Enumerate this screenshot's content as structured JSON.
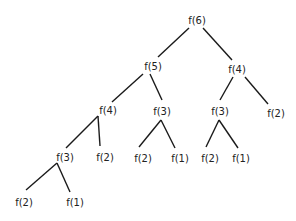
{
  "diagram": {
    "nodes": [
      {
        "id": "n0",
        "label": "f(6)",
        "x": 197,
        "y": 20
      },
      {
        "id": "n1",
        "label": "f(5)",
        "x": 153,
        "y": 66
      },
      {
        "id": "n2",
        "label": "f(4)",
        "x": 237,
        "y": 69
      },
      {
        "id": "n3",
        "label": "f(4)",
        "x": 108,
        "y": 110
      },
      {
        "id": "n4",
        "label": "f(3)",
        "x": 162,
        "y": 111
      },
      {
        "id": "n5",
        "label": "f(3)",
        "x": 220,
        "y": 111
      },
      {
        "id": "n6",
        "label": "f(2)",
        "x": 276,
        "y": 113
      },
      {
        "id": "n7",
        "label": "f(3)",
        "x": 65,
        "y": 157
      },
      {
        "id": "n8",
        "label": "f(2)",
        "x": 105,
        "y": 157
      },
      {
        "id": "n9",
        "label": "f(2)",
        "x": 143,
        "y": 158
      },
      {
        "id": "n10",
        "label": "f(1)",
        "x": 180,
        "y": 158
      },
      {
        "id": "n11",
        "label": "f(2)",
        "x": 210,
        "y": 158
      },
      {
        "id": "n12",
        "label": "f(1)",
        "x": 241,
        "y": 158
      },
      {
        "id": "n13",
        "label": "f(2)",
        "x": 24,
        "y": 202
      },
      {
        "id": "n14",
        "label": "f(1)",
        "x": 75,
        "y": 202
      }
    ],
    "edges": [
      {
        "from": "n0",
        "to": "n1",
        "x1": 189,
        "y1": 28,
        "x2": 158,
        "y2": 57
      },
      {
        "from": "n0",
        "to": "n2",
        "x1": 203,
        "y1": 28,
        "x2": 232,
        "y2": 60
      },
      {
        "from": "n1",
        "to": "n3",
        "x1": 143,
        "y1": 74,
        "x2": 112,
        "y2": 102
      },
      {
        "from": "n1",
        "to": "n4",
        "x1": 150,
        "y1": 74,
        "x2": 162,
        "y2": 100
      },
      {
        "from": "n2",
        "to": "n5",
        "x1": 233,
        "y1": 77,
        "x2": 220,
        "y2": 100
      },
      {
        "from": "n2",
        "to": "n6",
        "x1": 245,
        "y1": 77,
        "x2": 268,
        "y2": 104
      },
      {
        "from": "n3",
        "to": "n7",
        "x1": 98,
        "y1": 116,
        "x2": 66,
        "y2": 148
      },
      {
        "from": "n3",
        "to": "n8",
        "x1": 98,
        "y1": 116,
        "x2": 100,
        "y2": 146
      },
      {
        "from": "n4",
        "to": "n9",
        "x1": 161,
        "y1": 120,
        "x2": 139,
        "y2": 147
      },
      {
        "from": "n4",
        "to": "n10",
        "x1": 161,
        "y1": 120,
        "x2": 175,
        "y2": 148
      },
      {
        "from": "n5",
        "to": "n11",
        "x1": 219,
        "y1": 120,
        "x2": 206,
        "y2": 147
      },
      {
        "from": "n5",
        "to": "n12",
        "x1": 219,
        "y1": 120,
        "x2": 238,
        "y2": 148
      },
      {
        "from": "n7",
        "to": "n13",
        "x1": 57,
        "y1": 163,
        "x2": 26,
        "y2": 190
      },
      {
        "from": "n7",
        "to": "n14",
        "x1": 57,
        "y1": 163,
        "x2": 70,
        "y2": 192
      }
    ]
  }
}
